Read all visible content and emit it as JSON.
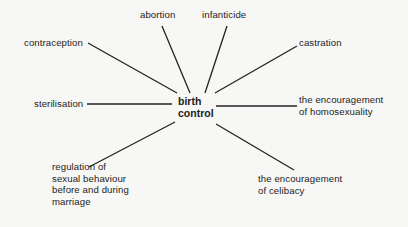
{
  "center": {
    "line1": "birth",
    "line2": "control"
  },
  "nodes": {
    "abortion": "abortion",
    "infanticide": "infanticide",
    "contraception": "contraception",
    "castration": "castration",
    "sterilisation": "sterilisation",
    "homosexuality": [
      "the encouragement",
      "of homosexuality"
    ],
    "regulation": [
      "regulation of",
      "sexual behaviour",
      "before and during",
      "marriage"
    ],
    "celibacy": [
      "the encouragement",
      "of celibacy"
    ]
  }
}
